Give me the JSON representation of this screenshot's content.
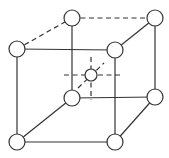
{
  "diagram": {
    "type": "bcc-unit-cell",
    "atoms": {
      "back_top_left": [
        72,
        18
      ],
      "back_top_right": [
        155,
        18
      ],
      "front_top_left": [
        17,
        49
      ],
      "front_top_right": [
        115,
        50
      ],
      "back_bottom_left": [
        72,
        98
      ],
      "back_bottom_right": [
        155,
        97
      ],
      "front_bottom_left": [
        17,
        142
      ],
      "front_bottom_right": [
        115,
        142
      ],
      "center": [
        91,
        75
      ]
    },
    "corner_radius": 8,
    "center_radius": 6,
    "colors": {
      "line": "#333333",
      "fill": "#ffffff"
    }
  }
}
